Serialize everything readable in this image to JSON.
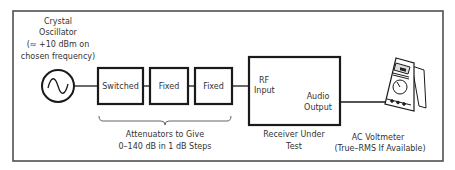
{
  "oscillator": {
    "label_lines": [
      "Crystal",
      "Oscillator",
      "(≈ +10 dBm on",
      "chosen frequency)"
    ],
    "icon": "sine-wave-icon"
  },
  "attenuators": {
    "boxes": [
      "Switched",
      "Fixed",
      "Fixed"
    ],
    "caption_lines": [
      "Attenuators to Give",
      "0–140 dB in 1 dB Steps"
    ]
  },
  "receiver": {
    "input_label_lines": [
      "RF",
      "Input"
    ],
    "output_label_lines": [
      "Audio",
      "Output"
    ],
    "caption_lines": [
      "Receiver Under",
      "Test"
    ]
  },
  "voltmeter": {
    "icon": "multimeter-icon",
    "caption_lines": [
      "AC Voltmeter",
      "(True–RMS If Available)"
    ]
  },
  "colors": {
    "line": "#1a1a1a",
    "frame": "#444444",
    "text": "#333333"
  }
}
